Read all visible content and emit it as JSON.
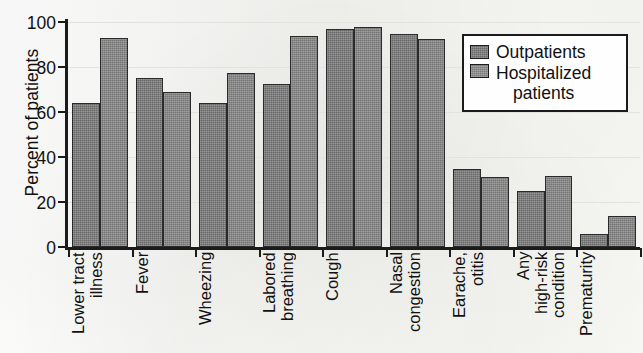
{
  "chart_data": {
    "type": "bar",
    "title": "",
    "xlabel": "",
    "ylabel": "Percent of patients",
    "ylim": [
      0,
      100
    ],
    "yticks": [
      0,
      20,
      40,
      60,
      80,
      100
    ],
    "grid": true,
    "legend_position": "upper-right",
    "categories": [
      "Lower tract\nillness",
      "Fever",
      "Wheezing",
      "Labored\nbreathing",
      "Cough",
      "Nasal\ncongestion",
      "Earache,\notitis",
      "Any\nhigh-risk\ncondition",
      "Prematurity"
    ],
    "series": [
      {
        "name": "Outpatients",
        "color": "#787878",
        "values": [
          64,
          75,
          64,
          72.5,
          97,
          94.5,
          34.5,
          25,
          6
        ]
      },
      {
        "name": "Hospitalized patients",
        "color": "#858585",
        "values": [
          93,
          69,
          77.5,
          94,
          98,
          92.5,
          31,
          31.5,
          14
        ]
      }
    ]
  },
  "legend": {
    "items": [
      {
        "label": "Outpatients"
      },
      {
        "label": "Hospitalized",
        "label_line2": "patients"
      }
    ]
  }
}
